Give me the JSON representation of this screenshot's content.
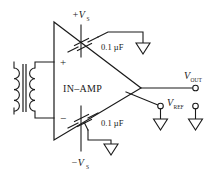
{
  "diagram": {
    "amplifier": {
      "block_label": "IN–AMP",
      "input_plus": "+",
      "input_minus": "−"
    },
    "supplies": {
      "positive_label": "+V",
      "positive_subscript": "S",
      "negative_label": "−V",
      "negative_subscript": "S"
    },
    "capacitors": [
      {
        "name": "top-decoupling-cap",
        "value": "0.1 µF"
      },
      {
        "name": "bottom-decoupling-cap",
        "value": "0.1 µF"
      }
    ],
    "terminals": [
      {
        "name": "v-out",
        "label": "V",
        "subscript": "OUT"
      },
      {
        "name": "v-ref",
        "label": "V",
        "subscript": "REF"
      }
    ],
    "grounds": [
      {
        "name": "ground-top-cap"
      },
      {
        "name": "ground-bottom-cap"
      },
      {
        "name": "ground-vref"
      },
      {
        "name": "ground-output-return"
      }
    ],
    "components": [
      {
        "name": "input-transformer",
        "type": "transformer",
        "turns": 4
      }
    ],
    "colors": {
      "ink": "#1a1a1a",
      "background": "#ffffff"
    }
  }
}
